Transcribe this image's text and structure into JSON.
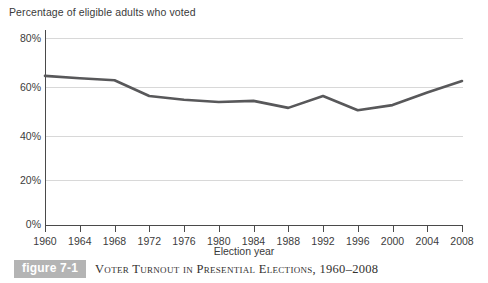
{
  "figure": {
    "badge_label": "figure 7-1",
    "caption": "Voter Turnout in Presential Elections, 1960–2008"
  },
  "chart_data": {
    "type": "line",
    "title": "Percentage of eligible adults who voted",
    "xlabel": "Election year",
    "ylabel": "",
    "categories": [
      1960,
      1964,
      1968,
      1972,
      1976,
      1980,
      1984,
      1988,
      1992,
      1996,
      2000,
      2004,
      2008
    ],
    "x_tick_labels": [
      "1960",
      "1964",
      "1968",
      "1972",
      "1976",
      "1980",
      "1984",
      "1988",
      "1992",
      "1996",
      "2000",
      "2004",
      "2008"
    ],
    "values": [
      63.8,
      62.8,
      61.9,
      55.2,
      53.6,
      52.6,
      53.1,
      50.1,
      55.2,
      49.1,
      51.3,
      56.7,
      61.6
    ],
    "series": [
      {
        "name": "Percentage of eligible adults who voted",
        "values": [
          63.8,
          62.8,
          61.9,
          55.2,
          53.6,
          52.6,
          53.1,
          50.1,
          55.2,
          49.1,
          51.3,
          56.7,
          61.6
        ]
      }
    ],
    "y_tick_labels": [
      "80%",
      "60%",
      "40%",
      "20%",
      "0%"
    ],
    "y_ticks": [
      80,
      60,
      40,
      20,
      0
    ],
    "ylim": [
      0,
      80
    ],
    "xlim": [
      1960,
      2008
    ],
    "grid": true,
    "legend": "none",
    "line_color": "#58585a",
    "grid_color": "#d8d8d8",
    "axis_color": "#4a4a4a"
  }
}
